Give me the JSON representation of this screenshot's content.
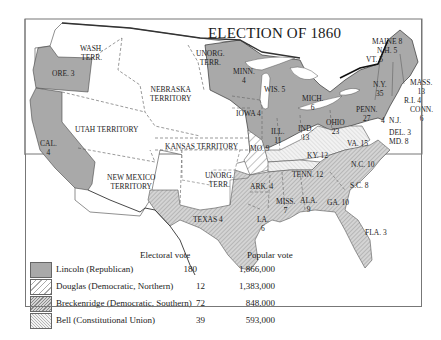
{
  "title": "ELECTION OF 1860",
  "colors": {
    "lincoln": "#a9a9a9",
    "douglas_bg": "#ffffff",
    "breckenridge_bg": "#cfcfcf",
    "bell_bg": "#ececec",
    "border": "#333333"
  },
  "labels": {
    "wash": "WASH.\nTERR.",
    "ore": "ORE. 3",
    "cal": "CAL.\n4",
    "nebraska": "NEBRASKA\nTERRITORY",
    "unorg_north": "UNORG.\nTERR.",
    "utah": "UTAH TERRITORY",
    "kansas": "KANSAS TERRITORY",
    "new_mexico": "NEW MEXICO\nTERRITORY",
    "unorg_south": "UNORG.\nTERR.",
    "texas": "TEXAS 4",
    "minn": "MINN.\n4",
    "wis": "WIS. 5",
    "iowa": "IOWA 4",
    "mich": "MICH.\n6",
    "ill": "ILL.\n11",
    "ind": "IND.\n13",
    "ohio": "OHIO\n23",
    "penn": "PENN.\n27",
    "ny": "N.Y.\n35",
    "maine": "MAINE 8",
    "nh": "N.H. 5",
    "vt": "VT. 5",
    "mass": "MASS.\n13",
    "ri": "R.I. 4",
    "conn": "CONN.\n6",
    "nj": "N.J.",
    "nj_val": "4",
    "nj_val2": "3",
    "del": "DEL. 3",
    "md": "MD. 8",
    "mo": "MO. 9",
    "ky": "KY. 12",
    "va": "VA. 15",
    "nc": "N.C. 10",
    "tenn": "TENN. 12",
    "sc": "S.C. 8",
    "ark": "ARK. 4",
    "miss": "MISS.\n7",
    "ala": "ALA.\n9",
    "ga": "GA. 10",
    "la": "LA.\n6",
    "fla": "FLA. 3"
  },
  "legend": {
    "header_electoral": "Electoral vote",
    "header_popular": "Popular vote",
    "rows": [
      {
        "name": "Lincoln (Republican)",
        "electoral": "180",
        "popular": "1,866,000"
      },
      {
        "name": "Douglas (Democratic, Northern)",
        "electoral": "12",
        "popular": "1,383,000"
      },
      {
        "name": "Breckenridge (Democratic, Southern)",
        "electoral": "72",
        "popular": "848,000"
      },
      {
        "name": "Bell (Constitutional Union)",
        "electoral": "39",
        "popular": "593,000"
      }
    ]
  }
}
